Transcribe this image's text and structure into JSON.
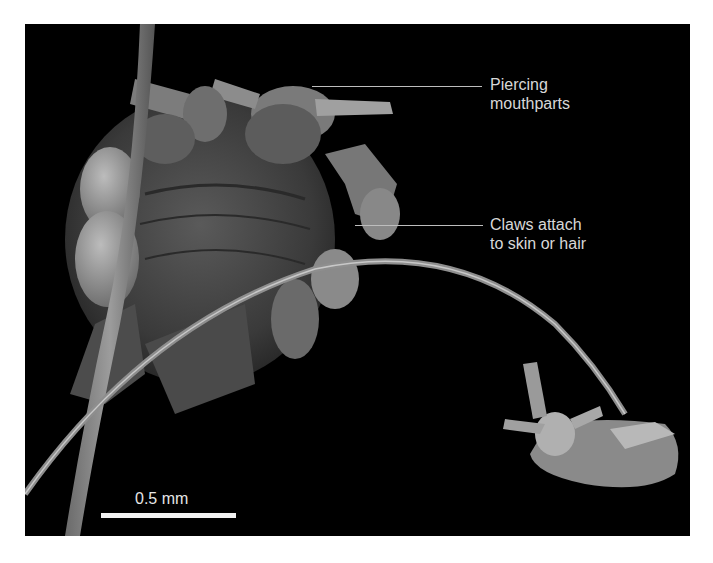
{
  "figure": {
    "labels": [
      {
        "line1": "Piercing",
        "line2": "mouthparts"
      },
      {
        "line1": "Claws attach",
        "line2": "to skin or hair"
      }
    ],
    "scale_bar": {
      "text": "0.5 mm"
    },
    "colors": {
      "background": "#000000",
      "label_text": "#d8d8d8",
      "specimen": "#8a8a8a",
      "page": "#ffffff"
    }
  }
}
